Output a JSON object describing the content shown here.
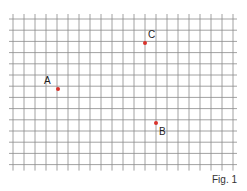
{
  "figure": {
    "caption": "Fig. 1",
    "grid": {
      "x0": 13,
      "y0": 19,
      "cols": 20,
      "rows": 13,
      "cell_w": 11,
      "cell_h": 11.2,
      "line_color": "#8a8a8a"
    },
    "points": [
      {
        "label": "A",
        "x": 58,
        "y": 89,
        "lx": 44,
        "ly": 76
      },
      {
        "label": "B",
        "x": 156,
        "y": 123,
        "lx": 159,
        "ly": 127
      },
      {
        "label": "C",
        "x": 145,
        "y": 43,
        "lx": 148,
        "ly": 30
      }
    ],
    "point_color": "#d9322b"
  }
}
